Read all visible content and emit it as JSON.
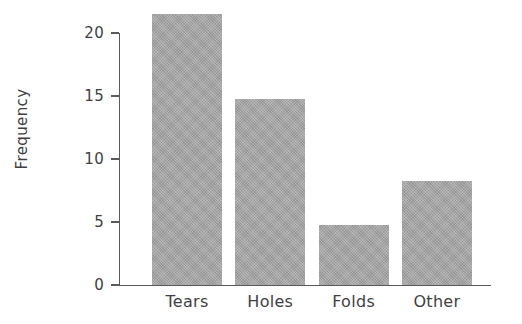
{
  "chart_data": {
    "type": "bar",
    "title": "",
    "subtitle": "",
    "xlabel": "",
    "ylabel": "Frequency",
    "categories": [
      "Tears",
      "Holes",
      "Folds",
      "Other"
    ],
    "values": [
      21.5,
      14.8,
      4.75,
      8.25
    ],
    "ylim": [
      0,
      22.5
    ],
    "y_ticks": [
      0,
      5,
      10,
      15,
      20
    ],
    "y_tick_labels": [
      "0",
      "5",
      "10",
      "15",
      "20"
    ],
    "x_tick_labels": [
      "Tears",
      "Holes",
      "Folds",
      "Other"
    ],
    "grid": false,
    "legend": false,
    "legend_position": "none",
    "bar_color": "#a3a3a3",
    "axis_color": "#5a5a5a",
    "text_color": "#3f3f3f",
    "background_color": "#ffffff"
  },
  "axes": {
    "y_title": "Frequency"
  }
}
